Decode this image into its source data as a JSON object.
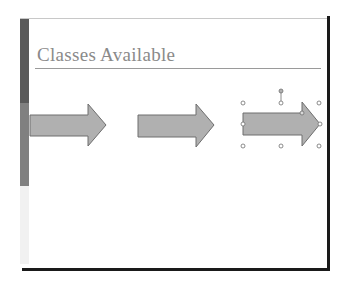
{
  "slide": {
    "title": "Classes Available",
    "accent_bar_colors": [
      "#5a5a5a",
      "#808080",
      "#f1f1f1"
    ],
    "frame_color": "#1a1a1a"
  },
  "shapes": [
    {
      "type": "right-arrow",
      "fill": "#b0b0b0",
      "stroke": "#6e6e6e",
      "selected": false
    },
    {
      "type": "right-arrow",
      "fill": "#b0b0b0",
      "stroke": "#6e6e6e",
      "selected": false
    },
    {
      "type": "right-arrow",
      "fill": "#b0b0b0",
      "stroke": "#6e6e6e",
      "selected": true
    }
  ],
  "selection": {
    "handles": [
      "top-left",
      "top-center",
      "top-right",
      "middle-left",
      "middle-right",
      "bottom-left",
      "bottom-center",
      "bottom-right"
    ],
    "rotation_handle": true,
    "adjustment_handle": true
  }
}
